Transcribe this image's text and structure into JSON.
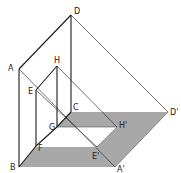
{
  "diagram": {
    "title": "",
    "colors": {
      "line": "#1a1a1a",
      "thin": "#333333",
      "shadow": "#a8a8a8"
    },
    "labels": {
      "A": "A",
      "B": "B",
      "C": "C",
      "D": "D",
      "E": "E",
      "F": "F",
      "G": "G",
      "H": "H",
      "H_prime": "H'",
      "D_prime": "D'",
      "E_prime": "E'",
      "A_prime": "A'"
    },
    "points": {
      "A": [
        19,
        69
      ],
      "B": [
        19,
        167
      ],
      "C": [
        71,
        112
      ],
      "D": [
        71,
        15
      ],
      "E": [
        36,
        90
      ],
      "F": [
        36,
        146
      ],
      "G": [
        57,
        127
      ],
      "H": [
        57,
        66
      ],
      "H_prime": [
        117,
        127
      ],
      "D_prime": [
        168,
        112
      ],
      "E_prime": [
        97,
        147
      ],
      "A_prime": [
        115,
        167
      ]
    }
  }
}
